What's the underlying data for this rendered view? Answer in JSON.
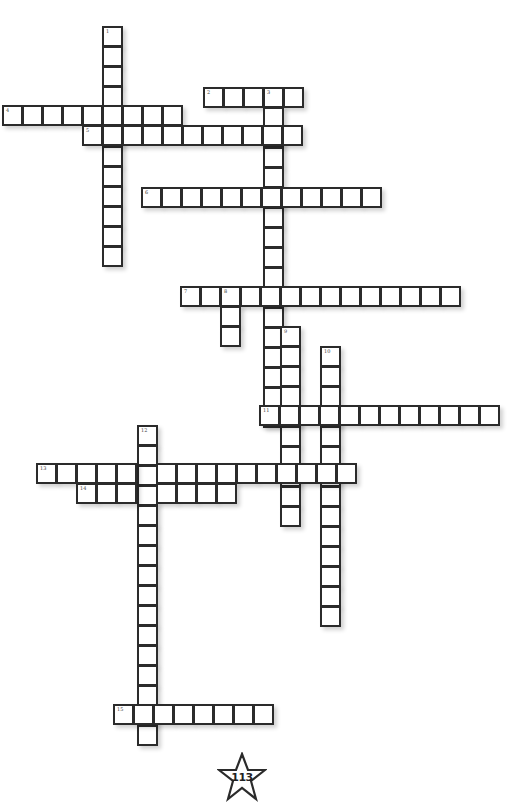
{
  "page": {
    "number": "113"
  },
  "puzzle": {
    "cell_size": 20,
    "words": [
      {
        "num": "1",
        "dir": "down",
        "x": 102,
        "y": 26,
        "len": 12
      },
      {
        "num": "2",
        "dir": "across",
        "x": 203,
        "y": 87,
        "len": 5
      },
      {
        "num": "3",
        "dir": "down",
        "x": 263,
        "y": 87,
        "len": 17
      },
      {
        "num": "4",
        "dir": "across",
        "x": 2,
        "y": 105,
        "len": 9
      },
      {
        "num": "5",
        "dir": "across",
        "x": 82,
        "y": 125,
        "len": 11
      },
      {
        "num": "6",
        "dir": "across",
        "x": 141,
        "y": 187,
        "len": 12
      },
      {
        "num": "7",
        "dir": "across",
        "x": 180,
        "y": 286,
        "len": 14
      },
      {
        "num": "8",
        "dir": "down",
        "x": 220,
        "y": 286,
        "len": 3
      },
      {
        "num": "9",
        "dir": "down",
        "x": 280,
        "y": 326,
        "len": 10
      },
      {
        "num": "10",
        "dir": "down",
        "x": 320,
        "y": 346,
        "len": 14
      },
      {
        "num": "11",
        "dir": "across",
        "x": 259,
        "y": 405,
        "len": 12
      },
      {
        "num": "12",
        "dir": "down",
        "x": 137,
        "y": 425,
        "len": 16
      },
      {
        "num": "13",
        "dir": "across",
        "x": 36,
        "y": 463,
        "len": 16
      },
      {
        "num": "14",
        "dir": "across",
        "x": 76,
        "y": 483,
        "len": 8
      },
      {
        "num": "15",
        "dir": "across",
        "x": 113,
        "y": 704,
        "len": 8
      }
    ]
  }
}
